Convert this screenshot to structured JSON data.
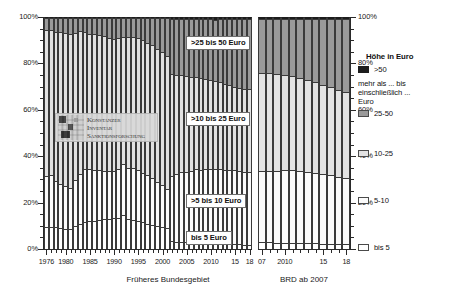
{
  "chart_data": {
    "type": "bar",
    "subtype": "100% stacked column",
    "title": "",
    "xlabel": "",
    "ylabel": "",
    "ylim": [
      0,
      100
    ],
    "ytick_labels": [
      "0%",
      "20%",
      "40%",
      "60%",
      "80%",
      "100%"
    ],
    "ytick_values": [
      0,
      20,
      40,
      60,
      80,
      100
    ],
    "grid": false,
    "legend_position": "right",
    "series": [
      {
        "name": "bis 5",
        "label_in_plot": "bis 5 Euro",
        "color": "#ffffff"
      },
      {
        "name": "5-10",
        "label_in_plot": ">5 bis 10 Euro",
        "color": "#fbfbfb"
      },
      {
        "name": "10-25",
        "label_in_plot": ">10 bis 25 Euro",
        "color": "#e2e2e2"
      },
      {
        "name": "25-50",
        "label_in_plot": ">25 bis 50 Euro",
        "color": "#9a9a9a"
      },
      {
        "name": ">50",
        "label_in_plot": "",
        "color": "#1d1d1d"
      }
    ],
    "panels": [
      {
        "id": "left",
        "title": "Früheres Bundesgebiet",
        "tick_labels": [
          "1976",
          "1980",
          "1985",
          "1990",
          "1995",
          "2000",
          "2005",
          "2010",
          "15",
          "18"
        ],
        "tick_years": [
          1976,
          1980,
          1985,
          1990,
          1995,
          2000,
          2005,
          2010,
          2015,
          2018
        ],
        "categories": [
          1976,
          1977,
          1978,
          1979,
          1980,
          1981,
          1982,
          1983,
          1984,
          1985,
          1986,
          1987,
          1988,
          1989,
          1990,
          1991,
          1992,
          1993,
          1994,
          1995,
          1996,
          1997,
          1998,
          1999,
          2000,
          2001,
          2002,
          2003,
          2004,
          2005,
          2006,
          2007,
          2008,
          2009,
          2010,
          2011,
          2012,
          2013,
          2014,
          2015,
          2016,
          2017,
          2018
        ],
        "values": {
          "bis 5": [
            9.5,
            9.5,
            9.3,
            9.0,
            8.8,
            8.5,
            10.0,
            11.0,
            11.5,
            12.0,
            12.3,
            12.5,
            12.8,
            13.0,
            13.2,
            13.5,
            14.5,
            13.0,
            12.5,
            12.0,
            11.5,
            11.0,
            10.5,
            10.0,
            9.5,
            9.0,
            3.5,
            3.2,
            3.0,
            3.0,
            2.8,
            2.8,
            2.6,
            2.5,
            2.5,
            2.4,
            2.3,
            2.2,
            2.1,
            2.0,
            2.0,
            1.9,
            1.8
          ],
          "5-10": [
            22.0,
            22.5,
            20.0,
            19.0,
            18.5,
            18.0,
            20.0,
            21.5,
            23.0,
            22.5,
            22.0,
            21.5,
            21.0,
            20.5,
            20.5,
            21.0,
            22.0,
            22.0,
            22.5,
            22.0,
            21.5,
            21.0,
            20.0,
            19.0,
            18.0,
            17.0,
            28.0,
            29.0,
            30.0,
            30.0,
            31.0,
            31.5,
            31.5,
            32.0,
            32.0,
            32.0,
            32.0,
            32.0,
            32.0,
            32.0,
            31.5,
            31.5,
            31.5
          ],
          "10-25": [
            63.0,
            62.5,
            64.5,
            65.5,
            66.0,
            66.5,
            63.5,
            61.5,
            59.0,
            58.5,
            58.5,
            58.5,
            58.0,
            57.5,
            57.0,
            56.5,
            55.0,
            56.5,
            56.5,
            57.0,
            57.0,
            57.0,
            57.5,
            57.5,
            57.5,
            57.5,
            44.0,
            43.0,
            42.0,
            41.5,
            40.5,
            40.0,
            39.5,
            39.0,
            38.5,
            38.0,
            37.5,
            37.0,
            36.5,
            36.0,
            36.0,
            35.5,
            35.5
          ],
          "25-50": [
            5.3,
            5.3,
            5.9,
            6.2,
            6.4,
            6.7,
            6.3,
            5.8,
            6.2,
            6.7,
            6.9,
            7.2,
            7.8,
            8.6,
            9.0,
            8.7,
            8.2,
            8.2,
            8.2,
            8.7,
            9.7,
            10.7,
            11.7,
            13.2,
            14.7,
            16.2,
            23.5,
            23.8,
            24.0,
            24.5,
            25.0,
            24.7,
            25.4,
            25.5,
            26.0,
            26.5,
            27.2,
            27.8,
            28.4,
            29.0,
            29.5,
            30.1,
            30.2
          ],
          ">50": [
            0.2,
            0.2,
            0.3,
            0.3,
            0.3,
            0.3,
            0.2,
            0.2,
            0.3,
            0.3,
            0.3,
            0.3,
            0.4,
            0.4,
            0.3,
            0.3,
            0.3,
            0.3,
            0.3,
            0.3,
            0.3,
            0.3,
            0.3,
            0.3,
            0.3,
            0.3,
            1.0,
            1.0,
            1.0,
            1.0,
            0.7,
            1.0,
            1.0,
            1.0,
            1.0,
            1.1,
            1.0,
            1.0,
            1.0,
            1.0,
            1.0,
            1.0,
            1.0
          ]
        }
      },
      {
        "id": "right",
        "title": "BRD ab 2007",
        "tick_labels": [
          "07",
          "2010",
          "15",
          "18"
        ],
        "tick_years": [
          2007,
          2010,
          2015,
          2018
        ],
        "categories": [
          2007,
          2008,
          2009,
          2010,
          2011,
          2012,
          2013,
          2014,
          2015,
          2016,
          2017,
          2018
        ],
        "values": {
          "bis 5": [
            3.0,
            2.9,
            2.8,
            2.8,
            2.7,
            2.6,
            2.5,
            2.4,
            2.3,
            2.2,
            2.1,
            2.0
          ],
          "5-10": [
            30.5,
            30.8,
            31.0,
            31.2,
            31.2,
            31.0,
            30.8,
            30.5,
            30.0,
            29.5,
            29.0,
            28.5
          ],
          "10-25": [
            42.5,
            42.0,
            41.5,
            41.0,
            40.5,
            40.0,
            39.5,
            39.0,
            38.5,
            38.0,
            37.5,
            37.0
          ],
          "25-50": [
            23.0,
            23.3,
            23.7,
            24.0,
            24.6,
            25.4,
            26.2,
            27.1,
            28.2,
            29.3,
            30.4,
            31.5
          ],
          ">50": [
            1.0,
            1.0,
            1.0,
            1.0,
            1.0,
            1.0,
            1.0,
            1.0,
            1.0,
            1.0,
            1.0,
            1.0
          ]
        }
      }
    ]
  },
  "axis": {
    "y_labels": [
      "100%",
      "80%",
      "60%",
      "40%",
      "20%",
      "0%"
    ]
  },
  "callouts": {
    "c25_50": ">25 bis 50 Euro",
    "c10_25": ">10 bis 25 Euro",
    "c5_10": ">5 bis 10 Euro",
    "c_bis5": "bis 5 Euro"
  },
  "panel_titles": {
    "left": "Früheres Bundesgebiet",
    "right": "BRD ab 2007"
  },
  "legend": {
    "title": "Höhe in Euro",
    "note_line1": "mehr als ... bis",
    "note_line2": "einschließlich ...",
    "note_line3": "Euro",
    "items": [
      {
        "label": ">50",
        "swatch": "gt50"
      },
      {
        "label": "25-50",
        "swatch": "25-50"
      },
      {
        "label": "10-25",
        "swatch": "10-25"
      },
      {
        "label": "5-10",
        "swatch": "5-10"
      },
      {
        "label": "bis 5",
        "swatch": "bis5"
      }
    ]
  },
  "watermark": {
    "line1": "Konstanzer",
    "line2": "Inventar",
    "line3": "Sanktionsforschung"
  }
}
